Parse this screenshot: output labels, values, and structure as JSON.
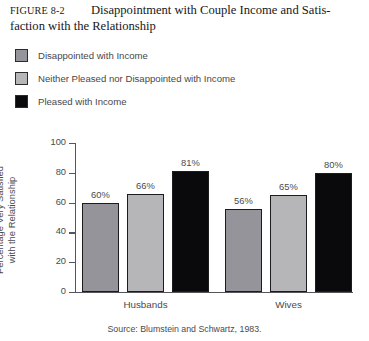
{
  "figure": {
    "label": "FIGURE 8-2",
    "title_line1": "Disappointment with Couple Income and Satis-",
    "title_line2": "faction with the Relationship"
  },
  "source": "Source: Blumstein and Schwartz, 1983.",
  "colors": {
    "series_disappointed": "#94949a",
    "series_neither": "#b6b6b8",
    "series_pleased": "#0a0a0c",
    "axis": "#55555a",
    "text": "#4a4a4c",
    "background": "#ffffff"
  },
  "legend": {
    "position": "above-plot",
    "items": [
      {
        "label": "Disappointed with Income",
        "color": "#94949a"
      },
      {
        "label": "Neither Pleased nor Disappointed with Income",
        "color": "#b6b6b8"
      },
      {
        "label": "Pleased with Income",
        "color": "#0a0a0c"
      }
    ]
  },
  "chart_data": {
    "type": "bar",
    "xlabel": "",
    "ylabel": "Percentage Very Satisfied with the Relationship",
    "ylabel_line1": "Percentage Very Satisfied",
    "ylabel_line2": "with the Relationship",
    "categories": [
      "Husbands",
      "Wives"
    ],
    "ylim": [
      0,
      100
    ],
    "yticks": [
      0,
      20,
      40,
      60,
      80,
      100
    ],
    "ytick_labels": [
      "0",
      "20",
      "40",
      "60",
      "80",
      "100"
    ],
    "grid": false,
    "legend_position": "above",
    "series": [
      {
        "name": "Disappointed with Income",
        "color": "#94949a",
        "values": [
          60,
          56
        ],
        "labels": [
          "60%",
          "56%"
        ]
      },
      {
        "name": "Neither Pleased nor Disappointed with Income",
        "color": "#b6b6b8",
        "values": [
          66,
          65
        ],
        "labels": [
          "66%",
          "65%"
        ]
      },
      {
        "name": "Pleased with Income",
        "color": "#0a0a0c",
        "values": [
          81,
          80
        ],
        "labels": [
          "81%",
          "80%"
        ]
      }
    ],
    "source": "Source: Blumstein and Schwartz, 1983."
  }
}
